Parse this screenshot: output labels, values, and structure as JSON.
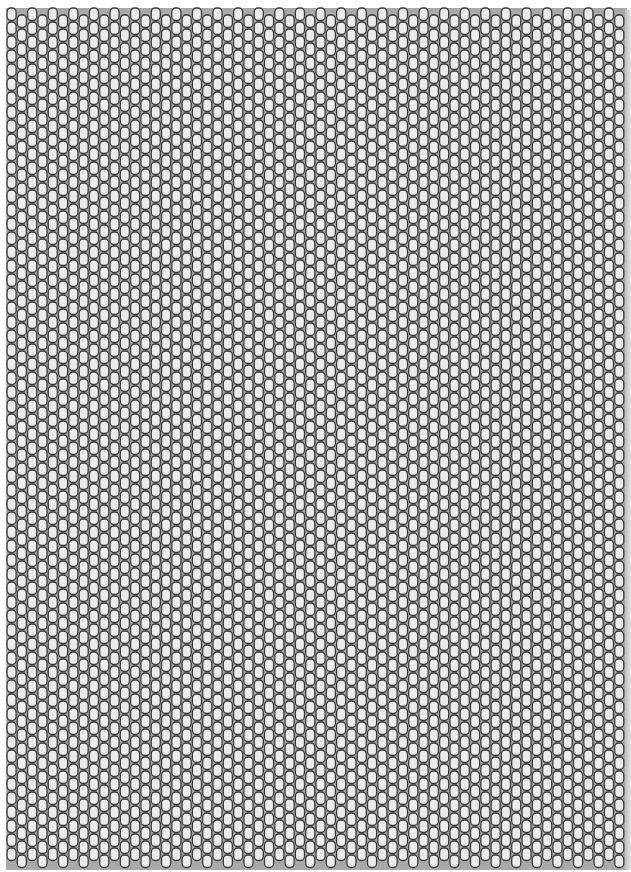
{
  "pattern": {
    "type": "peyote-bead-grid",
    "columns": 60,
    "rows_per_column": 61,
    "column_pitch_px": 10.3,
    "bead_height_px": 14,
    "origin_x": 7,
    "origin_y": 8,
    "offset_alternate_columns_px": 7
  },
  "colors": {
    "background": "#a9a9a9",
    "bead_fill": "#ebebeb",
    "bead_outline": "#3a3a3a"
  }
}
